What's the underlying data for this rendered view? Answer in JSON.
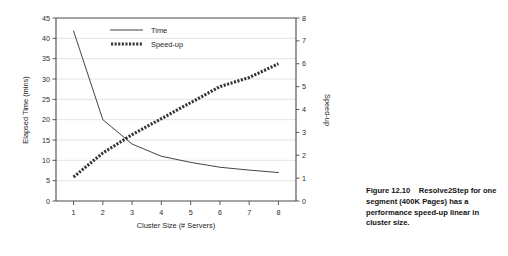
{
  "caption": {
    "text": "Figure 12.10    Resolve2Step for one segment (400K Pages) has a performance speed-up linear in cluster size."
  },
  "chart_data": {
    "type": "line",
    "title": "",
    "xlabel": "Cluster Size (# Servers)",
    "ylabel": "Elapsed Time (mins)",
    "y2label": "Speed-up",
    "x": [
      1,
      2,
      3,
      4,
      5,
      6,
      7,
      8
    ],
    "xlim": [
      0.4,
      8.6
    ],
    "xticks": [
      1,
      2,
      3,
      4,
      5,
      6,
      7,
      8
    ],
    "xticklabels": [
      "1",
      "2",
      "3",
      "4",
      "5",
      "6",
      "7",
      "8"
    ],
    "ylim": [
      0,
      45
    ],
    "yticks": [
      0,
      5,
      10,
      15,
      20,
      25,
      30,
      35,
      40,
      45
    ],
    "yticklabels": [
      "0",
      "5",
      "10",
      "15",
      "20",
      "25",
      "30",
      "35",
      "40",
      "45"
    ],
    "y2lim": [
      0,
      8
    ],
    "y2ticks": [
      0,
      1,
      2,
      3,
      4,
      5,
      6,
      7,
      8
    ],
    "y2ticklabels": [
      "0",
      "1",
      "2",
      "3",
      "4",
      "5",
      "6",
      "7",
      "8"
    ],
    "grid": true,
    "legend_position": "upper center",
    "series": [
      {
        "name": "Time",
        "axis": "left",
        "style": "solid",
        "color": "#3a3a3a",
        "values": [
          41.8,
          20.0,
          14.0,
          11.0,
          9.5,
          8.3,
          7.6,
          7.0
        ]
      },
      {
        "name": "Speed-up",
        "axis": "right",
        "style": "dotted",
        "color": "#333333",
        "values": [
          1.05,
          2.1,
          2.9,
          3.6,
          4.3,
          5.0,
          5.4,
          6.0
        ]
      }
    ]
  }
}
